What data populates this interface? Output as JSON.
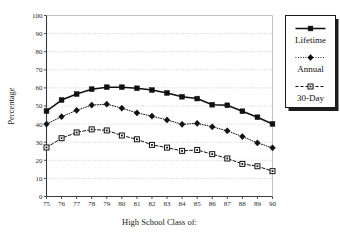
{
  "chart_data": {
    "type": "line",
    "title": "",
    "xlabel": "High School Class of:",
    "ylabel": "Percentage",
    "xlim": [
      75,
      90
    ],
    "ylim": [
      0,
      100
    ],
    "grid": true,
    "legend_position": "right",
    "categories": [
      "75",
      "76",
      "77",
      "78",
      "79",
      "80",
      "81",
      "82",
      "83",
      "84",
      "85",
      "86",
      "87",
      "88",
      "89",
      "90"
    ],
    "x_tick_labels": [
      "75",
      "76",
      "77",
      "78",
      "79",
      "80",
      "81",
      "82",
      "83",
      "84",
      "85",
      "86",
      "87",
      "88",
      "89",
      "90"
    ],
    "y_tick_labels": [
      "0",
      "10",
      "20",
      "30",
      "40",
      "50",
      "60",
      "70",
      "80",
      "90",
      "100"
    ],
    "y_ticks": [
      0,
      10,
      20,
      30,
      40,
      50,
      60,
      70,
      80,
      90,
      100
    ],
    "series": [
      {
        "name": "Lifetime",
        "marker": "filled-square",
        "line_style": "solid",
        "color": "#111111",
        "values": [
          47.2,
          53.3,
          56.6,
          59.3,
          60.4,
          60.4,
          59.8,
          58.8,
          57.2,
          55.1,
          54.1,
          50.7,
          50.4,
          47.1,
          43.8,
          40.1
        ]
      },
      {
        "name": "Annual",
        "marker": "filled-diamond",
        "line_style": "dotted",
        "color": "#111111",
        "values": [
          40.0,
          44.1,
          47.6,
          50.5,
          51.0,
          48.8,
          46.2,
          44.4,
          42.3,
          39.9,
          40.4,
          38.5,
          36.3,
          33.1,
          29.6,
          26.9
        ]
      },
      {
        "name": "30-Day",
        "marker": "open-square",
        "line_style": "dashed",
        "color": "#111111",
        "values": [
          27.1,
          32.2,
          35.4,
          37.1,
          36.5,
          33.7,
          31.6,
          28.5,
          27.0,
          25.2,
          25.7,
          23.4,
          21.0,
          18.0,
          16.7,
          14.0
        ]
      }
    ]
  },
  "legend": {
    "items": [
      {
        "label": "Lifetime",
        "swatch": "solid-line-filled-square"
      },
      {
        "label": "Annual",
        "swatch": "dotted-line-filled-diamond"
      },
      {
        "label": "30-Day",
        "swatch": "dashed-line-open-square"
      }
    ]
  },
  "colors": {
    "background": "#ffffff",
    "axis": "#3a3a3a",
    "grid": "#9a9a9a",
    "ink": "#111111",
    "legend_shadow": "#1d1d1d"
  }
}
